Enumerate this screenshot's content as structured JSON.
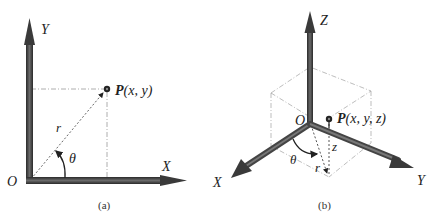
{
  "panels": [
    {
      "id": "a",
      "caption": "(a)",
      "title": "2D polar/cartesian coordinates",
      "axes": {
        "x_label": "X",
        "y_label": "Y",
        "origin_label": "O"
      },
      "point": {
        "name": "P",
        "coords": "(x, y)"
      },
      "radius_label": "r",
      "angle_label": "θ"
    },
    {
      "id": "b",
      "caption": "(b)",
      "title": "3D cylindrical coordinates",
      "axes": {
        "x_label": "X",
        "y_label": "Y",
        "z_label": "Z",
        "origin_label": "O"
      },
      "point": {
        "name": "P",
        "coords": "(x, y, z)"
      },
      "radius_label": "r",
      "angle_label": "θ",
      "height_label": "z"
    }
  ],
  "colors": {
    "axis": "#4a4a4a",
    "axis_dark": "#2e2e2e",
    "guide": "#9a9a9a",
    "dashed": "#555555"
  }
}
